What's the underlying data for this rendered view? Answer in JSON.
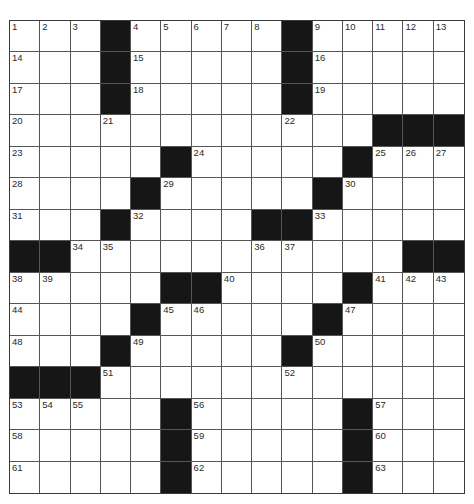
{
  "puzzle": {
    "rows": 15,
    "cols": 15,
    "colors": {
      "block": "#161616",
      "cell": "#ffffff",
      "line": "#555555",
      "number": "#2a2a2a"
    },
    "grid": [
      "...#.....#.....",
      "...#.....#.....",
      "...#.....#.....",
      "............###",
      ".....#.....#...",
      "....#.....#....",
      "...#....##.....",
      "##...........##",
      ".....##....#...",
      "....#.....#....",
      "...#.....#.....",
      "###............",
      ".....#.....#...",
      ".....#.....#...",
      ".....#.....#..."
    ],
    "numbers": [
      {
        "r": 0,
        "c": 0,
        "n": "1"
      },
      {
        "r": 0,
        "c": 1,
        "n": "2"
      },
      {
        "r": 0,
        "c": 2,
        "n": "3"
      },
      {
        "r": 0,
        "c": 4,
        "n": "4"
      },
      {
        "r": 0,
        "c": 5,
        "n": "5"
      },
      {
        "r": 0,
        "c": 6,
        "n": "6"
      },
      {
        "r": 0,
        "c": 7,
        "n": "7"
      },
      {
        "r": 0,
        "c": 8,
        "n": "8"
      },
      {
        "r": 0,
        "c": 10,
        "n": "9"
      },
      {
        "r": 0,
        "c": 11,
        "n": "10"
      },
      {
        "r": 0,
        "c": 12,
        "n": "11"
      },
      {
        "r": 0,
        "c": 13,
        "n": "12"
      },
      {
        "r": 0,
        "c": 14,
        "n": "13"
      },
      {
        "r": 1,
        "c": 0,
        "n": "14"
      },
      {
        "r": 1,
        "c": 4,
        "n": "15"
      },
      {
        "r": 1,
        "c": 10,
        "n": "16"
      },
      {
        "r": 2,
        "c": 0,
        "n": "17"
      },
      {
        "r": 2,
        "c": 4,
        "n": "18"
      },
      {
        "r": 2,
        "c": 10,
        "n": "19"
      },
      {
        "r": 3,
        "c": 0,
        "n": "20"
      },
      {
        "r": 3,
        "c": 3,
        "n": "21"
      },
      {
        "r": 3,
        "c": 9,
        "n": "22"
      },
      {
        "r": 4,
        "c": 0,
        "n": "23"
      },
      {
        "r": 4,
        "c": 6,
        "n": "24"
      },
      {
        "r": 4,
        "c": 12,
        "n": "25"
      },
      {
        "r": 4,
        "c": 13,
        "n": "26"
      },
      {
        "r": 4,
        "c": 14,
        "n": "27"
      },
      {
        "r": 5,
        "c": 0,
        "n": "28"
      },
      {
        "r": 5,
        "c": 5,
        "n": "29"
      },
      {
        "r": 5,
        "c": 11,
        "n": "30"
      },
      {
        "r": 6,
        "c": 0,
        "n": "31"
      },
      {
        "r": 6,
        "c": 4,
        "n": "32"
      },
      {
        "r": 6,
        "c": 10,
        "n": "33"
      },
      {
        "r": 7,
        "c": 2,
        "n": "34"
      },
      {
        "r": 7,
        "c": 3,
        "n": "35"
      },
      {
        "r": 7,
        "c": 8,
        "n": "36"
      },
      {
        "r": 7,
        "c": 9,
        "n": "37"
      },
      {
        "r": 8,
        "c": 0,
        "n": "38"
      },
      {
        "r": 8,
        "c": 1,
        "n": "39"
      },
      {
        "r": 8,
        "c": 7,
        "n": "40"
      },
      {
        "r": 8,
        "c": 12,
        "n": "41"
      },
      {
        "r": 8,
        "c": 13,
        "n": "42"
      },
      {
        "r": 8,
        "c": 14,
        "n": "43"
      },
      {
        "r": 9,
        "c": 0,
        "n": "44"
      },
      {
        "r": 9,
        "c": 5,
        "n": "45"
      },
      {
        "r": 9,
        "c": 6,
        "n": "46"
      },
      {
        "r": 9,
        "c": 11,
        "n": "47"
      },
      {
        "r": 10,
        "c": 0,
        "n": "48"
      },
      {
        "r": 10,
        "c": 4,
        "n": "49"
      },
      {
        "r": 10,
        "c": 10,
        "n": "50"
      },
      {
        "r": 11,
        "c": 3,
        "n": "51"
      },
      {
        "r": 11,
        "c": 9,
        "n": "52"
      },
      {
        "r": 12,
        "c": 0,
        "n": "53"
      },
      {
        "r": 12,
        "c": 1,
        "n": "54"
      },
      {
        "r": 12,
        "c": 2,
        "n": "55"
      },
      {
        "r": 12,
        "c": 6,
        "n": "56"
      },
      {
        "r": 12,
        "c": 12,
        "n": "57"
      },
      {
        "r": 13,
        "c": 0,
        "n": "58"
      },
      {
        "r": 13,
        "c": 6,
        "n": "59"
      },
      {
        "r": 13,
        "c": 12,
        "n": "60"
      },
      {
        "r": 14,
        "c": 0,
        "n": "61"
      },
      {
        "r": 14,
        "c": 6,
        "n": "62"
      },
      {
        "r": 14,
        "c": 12,
        "n": "63"
      }
    ]
  }
}
